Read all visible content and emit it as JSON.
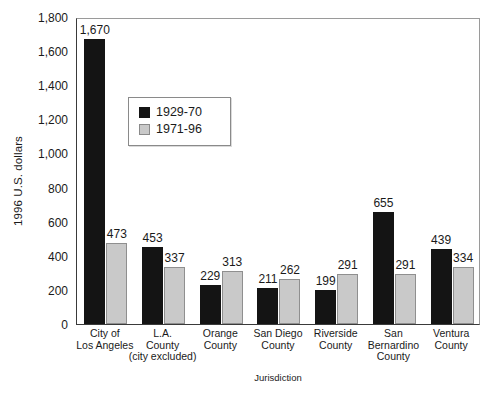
{
  "chart_data": {
    "type": "bar",
    "title": "",
    "xlabel": "Jurisdiction",
    "ylabel": "1996 U.S. dollars",
    "ylim": [
      0,
      1800
    ],
    "ytick_step": 200,
    "yticks": [
      "0",
      "200",
      "400",
      "600",
      "800",
      "1,000",
      "1,200",
      "1,400",
      "1,600",
      "1,800"
    ],
    "grid": false,
    "legend_position": "inside-upper-left",
    "categories": [
      "City of Los Angeles",
      "L.A. County (city excluded)",
      "Orange County",
      "San Diego County",
      "Riverside County",
      "San Bernardino County",
      "Ventura County"
    ],
    "category_lines": [
      [
        "City of",
        "Los Angeles"
      ],
      [
        "L.A.",
        "County",
        "(city excluded)"
      ],
      [
        "Orange",
        "County"
      ],
      [
        "San Diego",
        "County"
      ],
      [
        "Riverside",
        "County"
      ],
      [
        "San",
        "Bernardino",
        "County"
      ],
      [
        "Ventura",
        "County"
      ]
    ],
    "series": [
      {
        "name": "1929-70",
        "color": "#141414",
        "values": [
          1670,
          453,
          229,
          211,
          199,
          655,
          439
        ],
        "value_labels": [
          "1,670",
          "453",
          "229",
          "211",
          "199",
          "655",
          "439"
        ]
      },
      {
        "name": "1971-96",
        "color": "#c9c9c9",
        "values": [
          473,
          337,
          313,
          262,
          291,
          291,
          334
        ],
        "value_labels": [
          "473",
          "337",
          "313",
          "262",
          "291",
          "291",
          "334"
        ]
      }
    ]
  },
  "legend": {
    "items": [
      {
        "label": "1929-70",
        "swatch": "black-square-swatch"
      },
      {
        "label": "1971-96",
        "swatch": "gray-square-swatch"
      }
    ]
  },
  "axes": {
    "y_title": "1996 U.S. dollars",
    "x_title": "Jurisdiction"
  }
}
